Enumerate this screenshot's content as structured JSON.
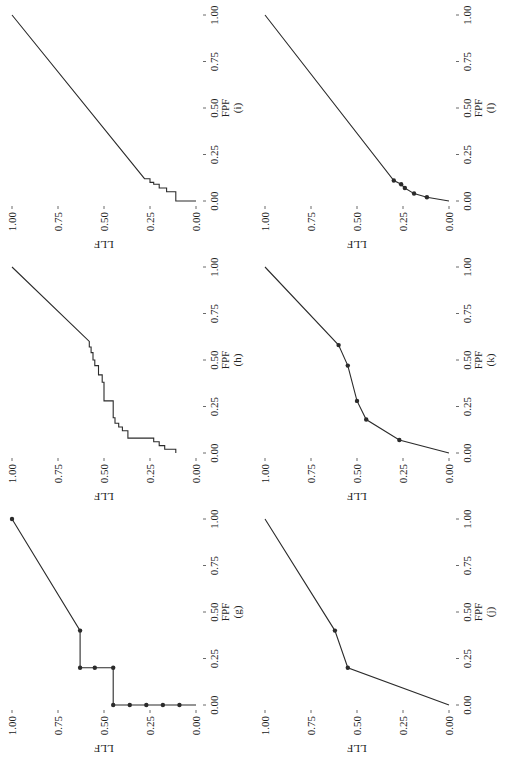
{
  "chart_data": [
    {
      "id": "g",
      "type": "line",
      "panel_label": "(g)",
      "xlabel": "FPF",
      "ylabel": "LLF",
      "xlim": [
        0,
        1
      ],
      "ylim": [
        0,
        1
      ],
      "xticks": [
        "0.00",
        "0.25",
        "0.50",
        "0.75",
        "1.00"
      ],
      "yticks": [
        "0.00",
        "0.25",
        "0.50",
        "0.75",
        "1.00"
      ],
      "grid": false,
      "markers": true,
      "points": [
        [
          0,
          0.09
        ],
        [
          0,
          0.18
        ],
        [
          0,
          0.27
        ],
        [
          0,
          0.36
        ],
        [
          0,
          0.45
        ],
        [
          0.2,
          0.45
        ],
        [
          0.2,
          0.55
        ],
        [
          0.2,
          0.63
        ],
        [
          0.4,
          0.63
        ],
        [
          1,
          1
        ]
      ],
      "path": [
        [
          0,
          0
        ],
        [
          0,
          0.45
        ],
        [
          0.2,
          0.45
        ],
        [
          0.2,
          0.63
        ],
        [
          0.4,
          0.63
        ],
        [
          1,
          1
        ]
      ]
    },
    {
      "id": "h",
      "type": "line",
      "panel_label": "(h)",
      "xlabel": "FPF",
      "ylabel": "LLF",
      "xlim": [
        0,
        1
      ],
      "ylim": [
        0,
        1
      ],
      "xticks": [
        "0.00",
        "0.25",
        "0.50",
        "0.75",
        "1.00"
      ],
      "yticks": [
        "0.00",
        "0.25",
        "0.50",
        "0.75",
        "1.00"
      ],
      "grid": false,
      "markers": false,
      "path": [
        [
          0,
          0.11
        ],
        [
          0.02,
          0.11
        ],
        [
          0.02,
          0.17
        ],
        [
          0.04,
          0.17
        ],
        [
          0.04,
          0.2
        ],
        [
          0.06,
          0.2
        ],
        [
          0.06,
          0.23
        ],
        [
          0.08,
          0.23
        ],
        [
          0.08,
          0.37
        ],
        [
          0.12,
          0.37
        ],
        [
          0.12,
          0.4
        ],
        [
          0.14,
          0.4
        ],
        [
          0.14,
          0.42
        ],
        [
          0.16,
          0.42
        ],
        [
          0.16,
          0.44
        ],
        [
          0.19,
          0.44
        ],
        [
          0.19,
          0.45
        ],
        [
          0.28,
          0.45
        ],
        [
          0.28,
          0.5
        ],
        [
          0.38,
          0.5
        ],
        [
          0.38,
          0.51
        ],
        [
          0.42,
          0.51
        ],
        [
          0.42,
          0.53
        ],
        [
          0.47,
          0.53
        ],
        [
          0.47,
          0.55
        ],
        [
          0.5,
          0.55
        ],
        [
          0.5,
          0.56
        ],
        [
          0.54,
          0.56
        ],
        [
          0.54,
          0.57
        ],
        [
          0.57,
          0.57
        ],
        [
          0.57,
          0.58
        ],
        [
          0.6,
          0.58
        ],
        [
          1,
          1
        ]
      ]
    },
    {
      "id": "i",
      "type": "line",
      "panel_label": "(i)",
      "xlabel": "FPF",
      "ylabel": "LLF",
      "xlim": [
        0,
        1
      ],
      "ylim": [
        0,
        1
      ],
      "xticks": [
        "0.00",
        "0.25",
        "0.50",
        "0.75",
        "1.00"
      ],
      "yticks": [
        "0.00",
        "0.25",
        "0.50",
        "0.75",
        "1.00"
      ],
      "grid": false,
      "markers": false,
      "path": [
        [
          0,
          0.0
        ],
        [
          0,
          0.11
        ],
        [
          0.05,
          0.11
        ],
        [
          0.05,
          0.16
        ],
        [
          0.07,
          0.16
        ],
        [
          0.07,
          0.2
        ],
        [
          0.09,
          0.2
        ],
        [
          0.09,
          0.23
        ],
        [
          0.1,
          0.23
        ],
        [
          0.1,
          0.25
        ],
        [
          0.12,
          0.25
        ],
        [
          0.12,
          0.28
        ],
        [
          1,
          1
        ]
      ]
    },
    {
      "id": "j",
      "type": "line",
      "panel_label": "(j)",
      "xlabel": "FPF",
      "ylabel": "LLF",
      "xlim": [
        0,
        1
      ],
      "ylim": [
        0,
        1
      ],
      "xticks": [
        "0.00",
        "0.25",
        "0.50",
        "0.75",
        "1.00"
      ],
      "yticks": [
        "0.00",
        "0.25",
        "0.50",
        "0.75",
        "1.00"
      ],
      "grid": false,
      "markers": true,
      "points": [
        [
          0.2,
          0.55
        ],
        [
          0.4,
          0.62
        ]
      ],
      "path": [
        [
          0,
          0
        ],
        [
          0.2,
          0.55
        ],
        [
          0.4,
          0.62
        ],
        [
          1,
          1
        ]
      ]
    },
    {
      "id": "k",
      "type": "line",
      "panel_label": "(k)",
      "xlabel": "FPF",
      "ylabel": "LLF",
      "xlim": [
        0,
        1
      ],
      "ylim": [
        0,
        1
      ],
      "xticks": [
        "0.00",
        "0.25",
        "0.50",
        "0.75",
        "1.00"
      ],
      "yticks": [
        "0.00",
        "0.25",
        "0.50",
        "0.75",
        "1.00"
      ],
      "grid": false,
      "markers": true,
      "points": [
        [
          0.07,
          0.27
        ],
        [
          0.18,
          0.45
        ],
        [
          0.28,
          0.5
        ],
        [
          0.47,
          0.55
        ],
        [
          0.58,
          0.6
        ]
      ],
      "path": [
        [
          0,
          0
        ],
        [
          0.07,
          0.27
        ],
        [
          0.18,
          0.45
        ],
        [
          0.28,
          0.5
        ],
        [
          0.47,
          0.55
        ],
        [
          0.58,
          0.6
        ],
        [
          1,
          1
        ]
      ]
    },
    {
      "id": "l",
      "type": "line",
      "panel_label": "(l)",
      "xlabel": "FPF",
      "ylabel": "LLF",
      "xlim": [
        0,
        1
      ],
      "ylim": [
        0,
        1
      ],
      "xticks": [
        "0.00",
        "0.25",
        "0.50",
        "0.75",
        "1.00"
      ],
      "yticks": [
        "0.00",
        "0.25",
        "0.50",
        "0.75",
        "1.00"
      ],
      "grid": false,
      "markers": true,
      "points": [
        [
          0.02,
          0.12
        ],
        [
          0.04,
          0.19
        ],
        [
          0.07,
          0.24
        ],
        [
          0.09,
          0.26
        ],
        [
          0.11,
          0.3
        ]
      ],
      "path": [
        [
          0,
          0
        ],
        [
          0.02,
          0.12
        ],
        [
          0.04,
          0.19
        ],
        [
          0.07,
          0.24
        ],
        [
          0.09,
          0.26
        ],
        [
          0.11,
          0.3
        ],
        [
          1,
          1
        ]
      ]
    }
  ],
  "layout": {
    "rows": [
      [
        "g",
        "h",
        "i"
      ],
      [
        "j",
        "k",
        "l"
      ]
    ],
    "line_color": "#2b2b2b",
    "text_color": "#222222"
  }
}
